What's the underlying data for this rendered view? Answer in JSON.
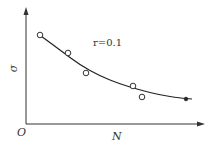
{
  "chart_data": {
    "type": "scatter",
    "title": "",
    "xlabel": "N",
    "ylabel": "σ",
    "origin_label": "O",
    "annotation": "r=0.1",
    "grid": false,
    "legend": null,
    "series": [
      {
        "name": "measured",
        "marker": "open-circle",
        "points": [
          [
            40,
            35
          ],
          [
            68,
            53
          ],
          [
            86,
            73
          ],
          [
            133,
            86
          ],
          [
            142,
            97
          ]
        ]
      },
      {
        "name": "fit-curve",
        "marker": "line",
        "points": [
          [
            41,
            36
          ],
          [
            60,
            50
          ],
          [
            80,
            65
          ],
          [
            100,
            76
          ],
          [
            120,
            84
          ],
          [
            140,
            90
          ],
          [
            160,
            95
          ],
          [
            180,
            98
          ],
          [
            192,
            99
          ]
        ]
      },
      {
        "name": "endpoint",
        "marker": "filled-circle",
        "points": [
          [
            186,
            99
          ]
        ]
      }
    ],
    "note": "Qualitative decreasing curve of σ vs N; no numeric axis ticks shown. Points in pixel coords."
  },
  "colors": {
    "axis": "#333333",
    "curve": "#222222",
    "marker": "#333333"
  }
}
